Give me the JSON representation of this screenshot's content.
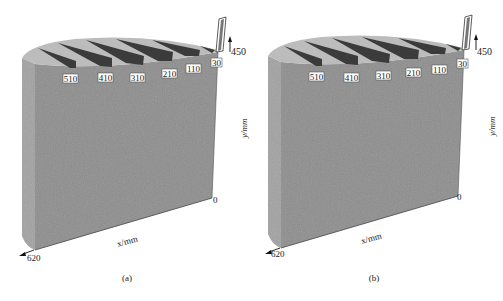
{
  "figure": {
    "panels": [
      {
        "id": "a",
        "caption": "(a)",
        "slot_labels": [
          "510",
          "410",
          "310",
          "210",
          "110",
          "30"
        ],
        "y_axis": {
          "label": "y/mm",
          "top": "450",
          "bottom": "0"
        },
        "x_axis": {
          "label": "x/mm",
          "start": "0",
          "end": "620"
        }
      },
      {
        "id": "b",
        "caption": "(b)",
        "slot_labels": [
          "510",
          "410",
          "310",
          "210",
          "110",
          "30"
        ],
        "y_axis": {
          "label": "y/mm",
          "top": "450",
          "bottom": "0"
        },
        "x_axis": {
          "label": "x/mm",
          "start": "0",
          "end": "620"
        }
      }
    ],
    "colors": {
      "front_face": "#8f8f8f",
      "side_face": "#a4a4a4",
      "top_face": "#b8b8b8",
      "slot": "#3a3a3a",
      "background": "#ffffff"
    }
  }
}
